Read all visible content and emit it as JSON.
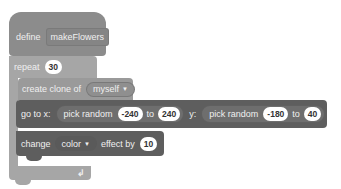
{
  "script": {
    "define_block": {
      "keyword": "define",
      "name": "makeFlowers",
      "color": "#8c8c8c"
    },
    "repeat_block": {
      "keyword": "repeat",
      "count": "30",
      "color": "#a6a6a6",
      "loop_icon": "loop-arrow-icon"
    },
    "create_clone_block": {
      "label": "create clone of",
      "target": "myself",
      "color": "#9a9a9a"
    },
    "go_to_block": {
      "label_x": "go to x:",
      "x_random_label": "pick random",
      "x_from": "-240",
      "x_to_label": "to",
      "x_to": "240",
      "label_y": "y:",
      "y_random_label": "pick random",
      "y_from": "-180",
      "y_to_label": "to",
      "y_to": "40",
      "color": "#5e5e5e",
      "reporter_color": "#6e6e6e"
    },
    "change_effect_block": {
      "label": "change",
      "effect": "color",
      "label_by": "effect by",
      "amount": "10",
      "color": "#5e5e5e"
    }
  }
}
